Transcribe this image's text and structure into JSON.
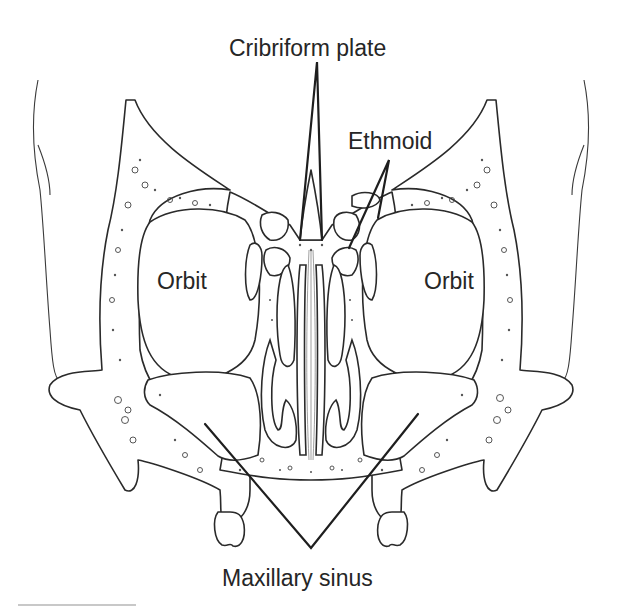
{
  "diagram": {
    "labels": {
      "cribriform_plate": "Cribriform plate",
      "ethmoid": "Ethmoid",
      "orbit_left": "Orbit",
      "orbit_right": "Orbit",
      "maxillary_sinus": "Maxillary sinus"
    },
    "colors": {
      "background": "#ffffff",
      "line": "#2a2a2a",
      "text": "#262626"
    }
  }
}
